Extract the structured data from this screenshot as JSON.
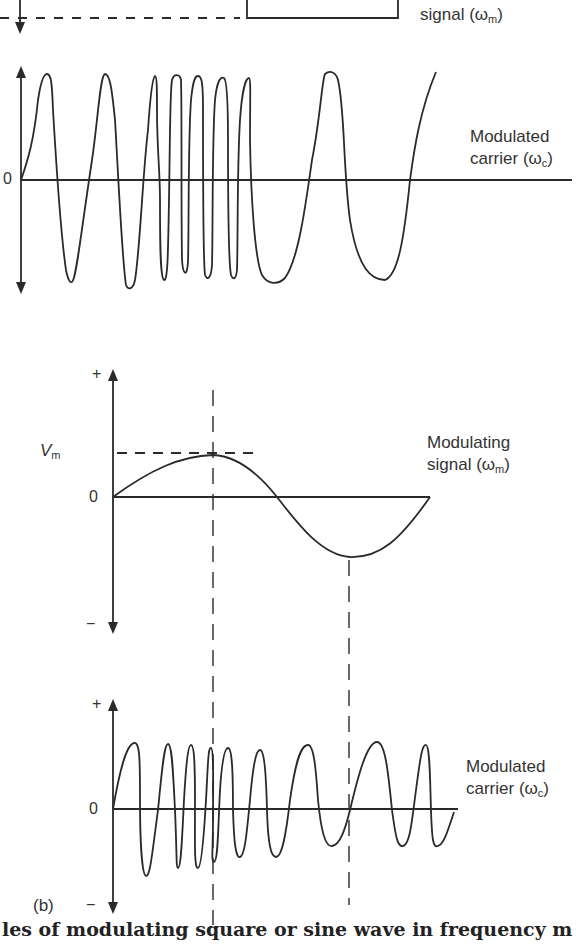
{
  "figure": {
    "panel_a": {
      "top_label_line2": "signal (ω",
      "top_label_sub": "m",
      "zero_label": "0",
      "carrier_label_line1": "Modulated",
      "carrier_label_line2": "carrier (ω",
      "carrier_label_sub": "c",
      "description": "Square-wave modulating signal (partially cropped) and resulting frequency-modulated carrier"
    },
    "panel_b": {
      "plus_label": "+",
      "minus_label": "−",
      "vm_label": "V",
      "vm_sub": "m",
      "zero_label": "0",
      "signal_label_line1": "Modulating",
      "signal_label_line2": "signal (ω",
      "signal_label_sub": "m",
      "carrier_plus_label": "+",
      "carrier_zero_label": "0",
      "carrier_minus_label": "−",
      "carrier_label_line1": "Modulated",
      "carrier_label_line2": "carrier (ω",
      "carrier_label_sub": "c",
      "panel_tag": "(b)"
    },
    "caption_partial": "les of modulating square or sine wave in frequency m",
    "close_paren": ")",
    "colors": {
      "line": "#2a2a2a",
      "background": "#ffffff"
    }
  }
}
